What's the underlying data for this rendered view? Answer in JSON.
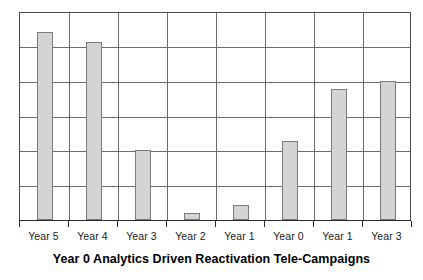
{
  "chart_data": {
    "type": "bar",
    "title": "Year 0 Analytics Driven Reactivation Tele-Campaigns",
    "xlabel": "",
    "ylabel": "",
    "categories": [
      "Year 5",
      "Year 4",
      "Year 3",
      "Year 2",
      "Year 1",
      "Year 0",
      "Year 1",
      "Year 3"
    ],
    "values": [
      5.4,
      5.11,
      2.0,
      0.2,
      0.43,
      2.27,
      3.76,
      4.0
    ],
    "ylim": [
      0,
      6
    ],
    "yticks": [
      0,
      1,
      2,
      3,
      4,
      5,
      6
    ],
    "ytick_labels_shown": false,
    "grid": true,
    "grid_axis": "y",
    "legend": false,
    "bar_color": "#d4d4d4",
    "bar_edge_color": "#7a7a7a",
    "grid_color": "#6b6b6b",
    "axis_color": "#2b2b2b",
    "background": "#ffffff"
  },
  "figure": {
    "title_text": "Year 0 Analytics Driven Reactivation Tele-Campaigns"
  }
}
